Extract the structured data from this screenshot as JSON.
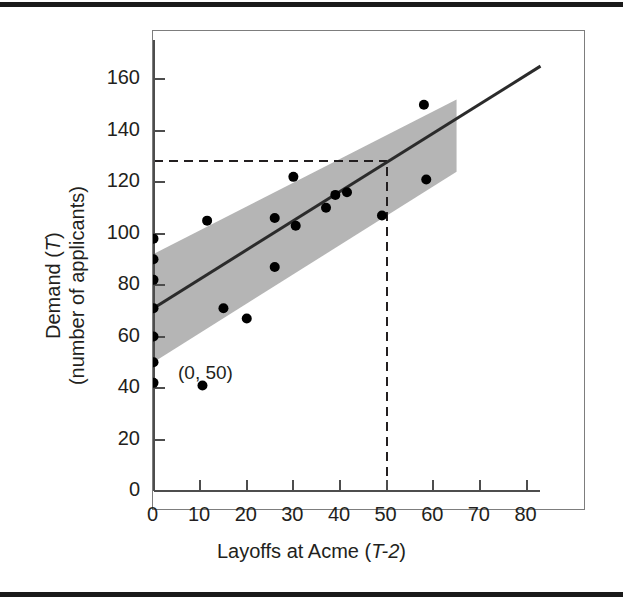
{
  "figure": {
    "background_color": "#ffffff",
    "rule_color": "#1a1a1a"
  },
  "annotations": {
    "origin_point_label": "(0, 50)"
  },
  "chart_data": {
    "type": "scatter",
    "title": "",
    "subtitle": "",
    "xlabel_plain": "Layoffs at Acme (T-2)",
    "xlabel_prefix": "Layoffs at Acme (",
    "xlabel_italic": "T-2",
    "xlabel_suffix": ")",
    "ylabel_line1_prefix": "Demand (",
    "ylabel_line1_italic": "T",
    "ylabel_line1_suffix": ")",
    "ylabel_line2": "(number of applicants)",
    "ylabel_plain": "Demand (T) (number of applicants)",
    "xlim": [
      0,
      83
    ],
    "ylim": [
      0,
      175
    ],
    "xticks": [
      0,
      10,
      20,
      30,
      40,
      50,
      60,
      70,
      80
    ],
    "xtick_labels": [
      "0",
      "10",
      "20",
      "30",
      "40",
      "50",
      "60",
      "70",
      "80"
    ],
    "yticks": [
      0,
      20,
      40,
      60,
      80,
      100,
      120,
      140,
      160
    ],
    "ytick_labels": [
      "0",
      "20",
      "40",
      "60",
      "80",
      "100",
      "120",
      "140",
      "160"
    ],
    "grid": false,
    "legend": null,
    "point_color": "#000000",
    "point_radius_px": 5,
    "points": [
      {
        "x": 0,
        "y": 98
      },
      {
        "x": 0,
        "y": 90
      },
      {
        "x": 0,
        "y": 82
      },
      {
        "x": 0,
        "y": 71
      },
      {
        "x": 0,
        "y": 60
      },
      {
        "x": 0,
        "y": 50
      },
      {
        "x": 0,
        "y": 42
      },
      {
        "x": 10.5,
        "y": 41
      },
      {
        "x": 11.5,
        "y": 105
      },
      {
        "x": 15,
        "y": 71
      },
      {
        "x": 20,
        "y": 67
      },
      {
        "x": 26,
        "y": 87
      },
      {
        "x": 26,
        "y": 106
      },
      {
        "x": 30,
        "y": 122
      },
      {
        "x": 30.5,
        "y": 103
      },
      {
        "x": 37,
        "y": 110
      },
      {
        "x": 39,
        "y": 115
      },
      {
        "x": 41.5,
        "y": 116
      },
      {
        "x": 49,
        "y": 107
      },
      {
        "x": 58,
        "y": 150
      },
      {
        "x": 58.5,
        "y": 121
      }
    ],
    "regression_line": {
      "name": "fitted regression line",
      "color": "#2b2b2b",
      "width_px": 3,
      "x_start": 0,
      "y_start": 71,
      "x_end": 83,
      "y_end": 165
    },
    "confidence_band": {
      "name": "prediction interval band",
      "fill_color": "#b5b5b5",
      "intercept_lower": 50,
      "intercept_upper": 92,
      "x_start": 0,
      "x_end": 65,
      "y_lower_start": 50,
      "y_upper_start": 92,
      "y_lower_end": 124,
      "y_upper_end": 152
    },
    "guide_lines": [
      {
        "name": "horizontal-prediction-guide",
        "orientation": "horizontal",
        "value": 128,
        "from_x": 0,
        "to_x": 50,
        "style": "dashed",
        "color": "#231f20"
      },
      {
        "name": "vertical-prediction-guide",
        "orientation": "vertical",
        "value": 50,
        "from_y": 0,
        "to_y": 128,
        "style": "dashed",
        "color": "#231f20"
      }
    ]
  }
}
